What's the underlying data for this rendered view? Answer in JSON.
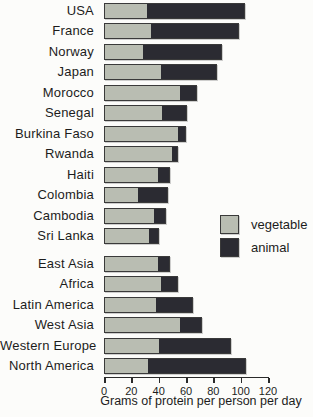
{
  "chart_data": {
    "type": "bar",
    "orientation": "horizontal",
    "stacked": true,
    "title": "",
    "xlabel": "Grams of protein per person per day",
    "xlim": [
      0,
      120
    ],
    "xticks": [
      0,
      20,
      40,
      60,
      80,
      100,
      120
    ],
    "grid": false,
    "legend_position": "right-middle",
    "colors": {
      "vegetable": "#b9bdb2",
      "animal": "#2b2b32"
    },
    "groups": [
      {
        "name": "countries",
        "categories": [
          "USA",
          "France",
          "Norway",
          "Japan",
          "Morocco",
          "Senegal",
          "Burkina Faso",
          "Rwanda",
          "Haiti",
          "Colombia",
          "Cambodia",
          "Sri Lanka"
        ],
        "series": [
          {
            "name": "vegetable",
            "values": [
              31,
              34,
              28,
              42,
              56,
              43,
              55,
              50,
              40,
              25,
              37,
              33
            ]
          },
          {
            "name": "animal",
            "values": [
              72,
              65,
              58,
              41,
              12,
              18,
              5,
              4,
              8,
              22,
              8,
              7
            ]
          }
        ]
      },
      {
        "name": "regions",
        "categories": [
          "East Asia",
          "Africa",
          "Latin America",
          "West Asia",
          "Western Europe",
          "North America"
        ],
        "series": [
          {
            "name": "vegetable",
            "values": [
              40,
              42,
              38,
              56,
              40,
              32
            ]
          },
          {
            "name": "animal",
            "values": [
              8,
              12,
              27,
              16,
              53,
              72
            ]
          }
        ]
      }
    ]
  },
  "legend": {
    "items": [
      {
        "label": "vegetable",
        "color": "#b9bdb2"
      },
      {
        "label": "animal",
        "color": "#2b2b32"
      }
    ]
  }
}
